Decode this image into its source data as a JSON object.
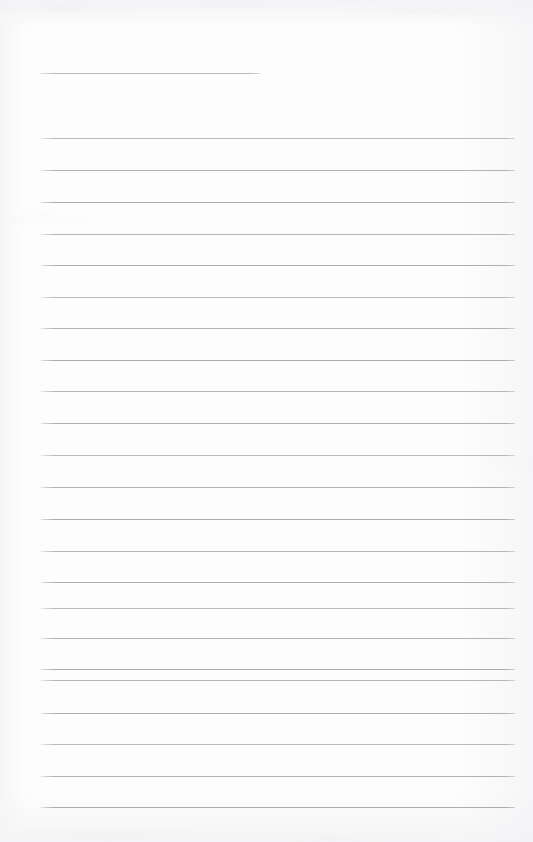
{
  "page": {
    "kind": "blank-lined-notebook-page",
    "width": 533,
    "height": 842,
    "background_color": "#fdfdfd",
    "rule_color": "#a9a9ae",
    "header_rule_color": "#b6b6bb",
    "text_content": "",
    "handwriting_present": "none",
    "margin_rule_present": "none"
  },
  "header_rule": {
    "name": "header-rule",
    "x": 40,
    "y": 73,
    "width": 220,
    "note": "short ruled line near top of page"
  },
  "body_rules": {
    "left_x": 41,
    "right_x": 515,
    "width": 474,
    "count": 22,
    "spacing": 31.8,
    "y_positions": [
      138,
      170,
      202,
      234,
      265,
      297,
      328,
      360,
      391,
      423,
      455,
      487,
      519,
      551,
      582,
      608,
      638,
      669,
      680,
      713,
      744,
      776,
      807
    ]
  }
}
